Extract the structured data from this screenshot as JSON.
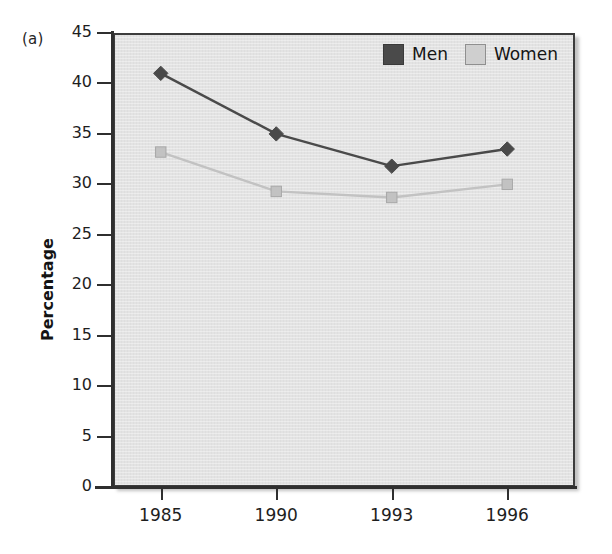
{
  "figure": {
    "panel_label": "(a)"
  },
  "chart_data": {
    "type": "line",
    "title": "",
    "subtitle": "",
    "xlabel": "",
    "ylabel": "Percentage",
    "categories": [
      "1985",
      "1990",
      "1993",
      "1996"
    ],
    "series": [
      {
        "name": "Men",
        "values": [
          41.0,
          35.0,
          31.8,
          33.5
        ],
        "color": "#4a4a4a",
        "marker": "diamond"
      },
      {
        "name": "Women",
        "values": [
          33.2,
          29.3,
          28.7,
          30.0
        ],
        "color": "#c2c2c2",
        "marker": "square"
      }
    ],
    "ylim": [
      0,
      45
    ],
    "y_ticks": [
      "0",
      "5",
      "10",
      "15",
      "20",
      "25",
      "30",
      "35",
      "40",
      "45"
    ],
    "grid": false,
    "legend_position": "top-right-inside",
    "plot_background": "#e3e3e3"
  },
  "legend": {
    "entries": [
      {
        "label": "Men",
        "swatch_color": "#4a4a4a",
        "swatch_border": "#3a3a3a"
      },
      {
        "label": "Women",
        "swatch_color": "#cfcfcf",
        "swatch_border": "#8f8f8f"
      }
    ]
  }
}
